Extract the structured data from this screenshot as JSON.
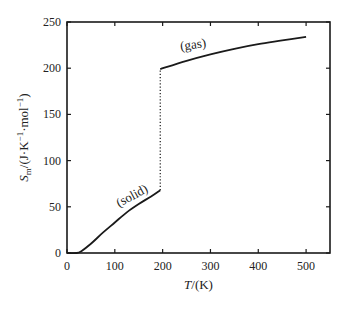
{
  "chart_data": {
    "type": "line",
    "title": "",
    "xlabel": "T/(K)",
    "xlabel_parts": {
      "var": "T",
      "unit": "/(K)"
    },
    "ylabel": "S_m/(J·K⁻¹·mol⁻¹)",
    "ylabel_parts": {
      "var": "S",
      "sub": "m",
      "unit": "/(J·K",
      "e1": "−1",
      "mid": "·mol",
      "e2": "−1",
      "end": ")"
    },
    "xlim": [
      0,
      550
    ],
    "ylim": [
      0,
      250
    ],
    "xticks": [
      0,
      100,
      200,
      300,
      400,
      500
    ],
    "yticks": [
      0,
      50,
      100,
      150,
      200,
      250
    ],
    "grid": false,
    "legend": null,
    "series": [
      {
        "name": "solid",
        "style": "solid",
        "x": [
          0,
          20,
          30,
          50,
          75,
          100,
          125,
          150,
          175,
          195
        ],
        "y": [
          0,
          0,
          2,
          10,
          22,
          33,
          44,
          53,
          61,
          68
        ]
      },
      {
        "name": "phase transition",
        "style": "dotted",
        "x": [
          195,
          195
        ],
        "y": [
          68,
          199
        ]
      },
      {
        "name": "gas",
        "style": "solid",
        "x": [
          195,
          250,
          300,
          350,
          400,
          450,
          500
        ],
        "y": [
          199,
          208,
          215,
          221,
          226,
          230,
          234
        ]
      }
    ],
    "annotations": [
      {
        "text": "(solid)",
        "x": 140,
        "y": 58,
        "rotate": -28
      },
      {
        "text": "(gas)",
        "x": 265,
        "y": 221,
        "rotate": -8
      }
    ]
  },
  "colors": {
    "line": "#1a1a1a",
    "axis": "#1a1a1a",
    "background": "#ffffff"
  }
}
